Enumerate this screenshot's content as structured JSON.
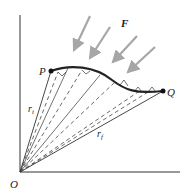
{
  "diagram": {
    "labels": {
      "origin": "O",
      "start_point": "P",
      "end_point": "Q",
      "force": "F",
      "r_initial": "r",
      "r_initial_sub": "i",
      "r_final": "r",
      "r_final_sub": "f"
    },
    "colors": {
      "axis": "#333333",
      "curve": "#222222",
      "arrow": "#a6a6a6",
      "dashed": "#444444"
    }
  }
}
